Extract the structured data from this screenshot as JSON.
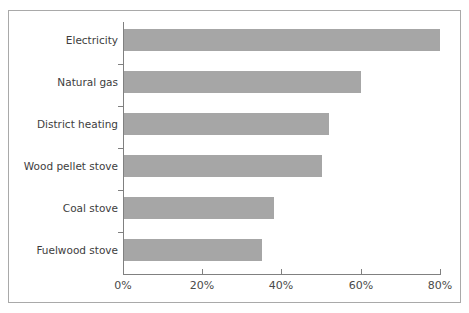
{
  "chart_data": {
    "type": "bar",
    "orientation": "horizontal",
    "title": "",
    "xlabel": "",
    "ylabel": "",
    "categories": [
      "Electricity",
      "Natural gas",
      "District heating",
      "Wood pellet stove",
      "Coal stove",
      "Fuelwood stove"
    ],
    "values": [
      80,
      60,
      52,
      50,
      38,
      35
    ],
    "value_suffix": "%",
    "xlim": [
      0,
      80
    ],
    "xticks": [
      0,
      20,
      40,
      60,
      80
    ],
    "xtick_labels": [
      "0%",
      "20%",
      "40%",
      "60%",
      "80%"
    ],
    "grid": false,
    "legend": null,
    "bar_color": "#a6a6a6",
    "axis_color": "#808080",
    "frame_color": "#a9a9a9",
    "background": "#ffffff"
  }
}
